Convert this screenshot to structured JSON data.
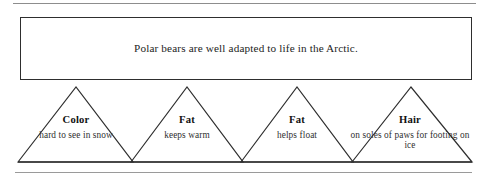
{
  "diagram": {
    "statement": {
      "text": "Polar bears are well adapted to life in the Arctic."
    },
    "triangles": [
      {
        "title": "Color",
        "description": "hard to see in snow"
      },
      {
        "title": "Fat",
        "description": "keeps warm"
      },
      {
        "title": "Fat",
        "description": "helps float"
      },
      {
        "title": "Hair",
        "description": "on soles of paws for footing on ice"
      }
    ],
    "colors": {
      "line": "#2e2e2e",
      "rule": "#9a9a9a",
      "text": "#232323",
      "background": "#ffffff"
    }
  }
}
